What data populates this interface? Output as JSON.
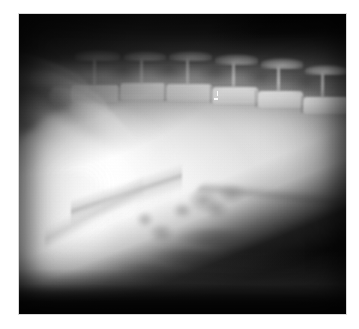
{
  "image": {
    "kind": "radiograph",
    "modality": "X-ray",
    "view": "lateral abdominal",
    "subject": "small animal abdomen",
    "orientation": "cranial-left, dorsal-up",
    "background_color": "#ffffff",
    "plate": {
      "x": 19,
      "y": 14,
      "width": 327,
      "height": 300,
      "border_color": "#d8d8d8",
      "film_base_color": "#0b0b0b"
    },
    "tone": {
      "darkest": "#060606",
      "mid_gray": "#8a8a8a",
      "soft_tissue": "#c8c8c8",
      "bone_bright": "#f2f2f2",
      "brightest": "#ffffff"
    },
    "regions": [
      {
        "name": "dark-air-band-top",
        "description": "black collimated air band across the top of the film"
      },
      {
        "name": "dark-corner-upper-left",
        "description": "dark wedge at the upper-left corner"
      },
      {
        "name": "caudal-ribs",
        "description": "overlapping caudal rib shadows in the upper-left quadrant"
      },
      {
        "name": "lumbar-spine",
        "description": "lumbar vertebral bodies with tall dorsal spinous processes along the top third"
      },
      {
        "name": "abdominal-mass",
        "description": "large homogeneous soft-tissue opacity filling the cranioventral abdomen"
      },
      {
        "name": "mass-margin",
        "description": "sharp diagonal caudoventral margin of the mass"
      },
      {
        "name": "bowel-gas",
        "description": "mottled gas and intestinal shadows in the mid-caudal abdomen"
      },
      {
        "name": "ventral-body-wall",
        "description": "ventral abdominal wall sloping caudally toward the lower-right"
      },
      {
        "name": "dark-corner-lower-right",
        "description": "black table/off-body region at the lower-right"
      },
      {
        "name": "dark-band-bottom",
        "description": "black band along the bottom edge of the film"
      }
    ],
    "spine": {
      "label": "lumbar vertebrae",
      "vertebra_count": 7,
      "spinous_process_count": 6
    },
    "markers": {
      "artifact_label": "bright film artifact",
      "artifact_count": 2
    }
  }
}
